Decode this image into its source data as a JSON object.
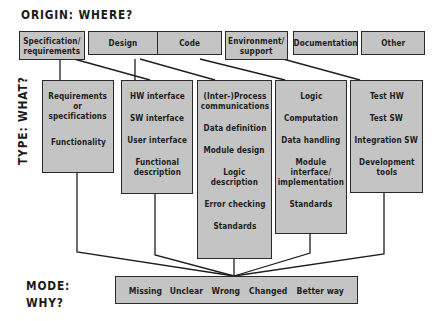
{
  "headings": {
    "origin": "ORIGIN:  WHERE?",
    "type": "TYPE:  WHAT?",
    "mode_line1": "MODE:",
    "mode_line2": "WHY?"
  },
  "origin_boxes": [
    {
      "label": "Specification/\nrequirements"
    },
    {
      "label": "Design"
    },
    {
      "label": "Code"
    },
    {
      "label": "Environment/\nsupport"
    },
    {
      "label": "Documentation"
    },
    {
      "label": "Other"
    }
  ],
  "type_boxes": [
    {
      "items": [
        "Requirements\nor\nspecifications",
        "Functionality"
      ]
    },
    {
      "items": [
        "HW interface",
        "SW interface",
        "User interface",
        "Functional\ndescription"
      ]
    },
    {
      "items": [
        "(Inter-)Process\ncommunications",
        "Data definition",
        "Module design",
        "Logic\ndescription",
        "Error checking",
        "Standards"
      ]
    },
    {
      "items": [
        "Logic",
        "Computation",
        "Data handling",
        "Module\ninterface/\nimplementation",
        "Standards"
      ]
    },
    {
      "items": [
        "Test HW",
        "Test SW",
        "Integration SW",
        "Development\ntools"
      ]
    }
  ],
  "mode_items": [
    "Missing",
    "Unclear",
    "Wrong",
    "Changed",
    "Better way"
  ],
  "colors": {
    "box_fill": "#c4c4c4",
    "box_border": "#2a2a2a",
    "text": "#1e1e1e",
    "background": "#ffffff"
  }
}
